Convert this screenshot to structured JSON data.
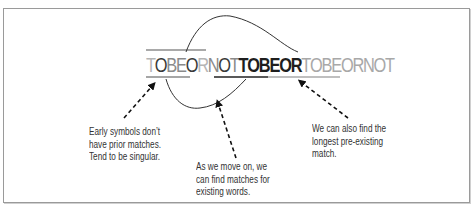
{
  "diagram": {
    "sequence": [
      {
        "ch": "T",
        "tone": "light"
      },
      {
        "ch": "O",
        "tone": "dark"
      },
      {
        "ch": "B",
        "tone": "mid"
      },
      {
        "ch": "E",
        "tone": "mid"
      },
      {
        "ch": "O",
        "tone": "dark"
      },
      {
        "ch": "R",
        "tone": "light"
      },
      {
        "ch": "N",
        "tone": "mid"
      },
      {
        "ch": "O",
        "tone": "dark"
      },
      {
        "ch": "T",
        "tone": "mid"
      },
      {
        "ch": "T",
        "tone": "bold"
      },
      {
        "ch": "O",
        "tone": "bold"
      },
      {
        "ch": "B",
        "tone": "bold"
      },
      {
        "ch": "E",
        "tone": "bold"
      },
      {
        "ch": "O",
        "tone": "bold"
      },
      {
        "ch": "R",
        "tone": "bold"
      },
      {
        "ch": "T",
        "tone": "faint"
      },
      {
        "ch": "O",
        "tone": "faint"
      },
      {
        "ch": "B",
        "tone": "faint"
      },
      {
        "ch": "E",
        "tone": "faint"
      },
      {
        "ch": "O",
        "tone": "faint"
      },
      {
        "ch": "R",
        "tone": "faint"
      },
      {
        "ch": "N",
        "tone": "faint"
      },
      {
        "ch": "O",
        "tone": "faint"
      },
      {
        "ch": "T",
        "tone": "faint"
      }
    ],
    "tones": {
      "light": "#b5b5b5",
      "mid": "#8a8a8a",
      "dark": "#3a3a3a",
      "bold": "#1e1e1e",
      "faint": "#a8a8a8"
    },
    "notes": {
      "early": [
        "Early symbols don’t",
        "have prior matches.",
        "Tend to be singular."
      ],
      "move_on": [
        "As we move on, we",
        "can find matches for",
        "existing words."
      ],
      "longest": [
        "We can also find the",
        "longest pre-existing",
        "match."
      ]
    }
  }
}
